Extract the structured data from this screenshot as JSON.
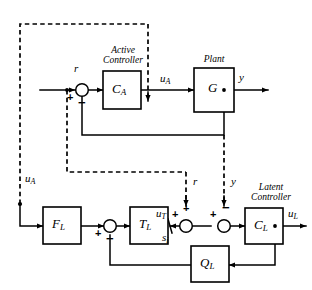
{
  "figure": {
    "kind": "control-system-block-diagram",
    "background_color": "#ffffff",
    "line_color": "#000000",
    "width": 312,
    "height": 290
  },
  "blocks": [
    {
      "id": "ca",
      "label": "C",
      "sub": "A",
      "title_line1": "Active",
      "title_line2": "Controller"
    },
    {
      "id": "g",
      "label": "G",
      "sub": "",
      "title_line1": "Plant",
      "title_line2": ""
    },
    {
      "id": "fl",
      "label": "F",
      "sub": "L",
      "title_line1": "",
      "title_line2": ""
    },
    {
      "id": "tl",
      "label": "T",
      "sub": "L",
      "title_line1": "",
      "title_line2": ""
    },
    {
      "id": "cl",
      "label": "C",
      "sub": "L",
      "title_line1": "Latent",
      "title_line2": "Controller"
    },
    {
      "id": "ql",
      "label": "Q",
      "sub": "L",
      "title_line1": "",
      "title_line2": ""
    }
  ],
  "signals": [
    {
      "id": "r_in",
      "label": "r",
      "sub": ""
    },
    {
      "id": "u_a_top",
      "label": "u",
      "sub": "A"
    },
    {
      "id": "y_out",
      "label": "y",
      "sub": ""
    },
    {
      "id": "u_a_left",
      "label": "u",
      "sub": "A"
    },
    {
      "id": "r_mid",
      "label": "r",
      "sub": ""
    },
    {
      "id": "y_mid",
      "label": "y",
      "sub": ""
    },
    {
      "id": "u_t",
      "label": "u",
      "sub": "T"
    },
    {
      "id": "s_i",
      "label": "s",
      "sub": "i"
    },
    {
      "id": "u_l",
      "label": "u",
      "sub": "L"
    }
  ],
  "summing_junctions": [
    {
      "id": "sum-active",
      "signs": [
        "+",
        "−"
      ]
    },
    {
      "id": "sum-fl-tl",
      "signs": [
        "+",
        "−"
      ]
    },
    {
      "id": "sum-ut-r",
      "signs": [
        "+",
        "+"
      ]
    },
    {
      "id": "sum-cl",
      "signs": [
        "+",
        "−"
      ]
    }
  ],
  "signs": {
    "plus": "+",
    "minus": "−"
  }
}
